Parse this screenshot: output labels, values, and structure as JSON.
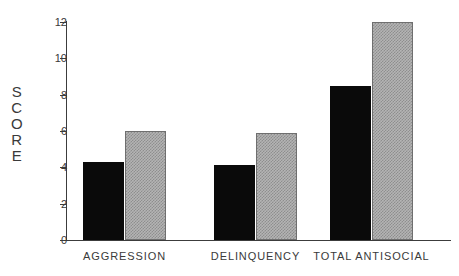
{
  "chart_data": {
    "type": "bar",
    "title": "",
    "xlabel": "",
    "ylabel": "SCORE",
    "categories": [
      "AGGRESSION",
      "DELINQUENCY",
      "TOTAL ANTISOCIAL"
    ],
    "series": [
      {
        "name": "black-series",
        "color": "#0a0a0a",
        "values": [
          4.3,
          4.15,
          8.5
        ]
      },
      {
        "name": "gray-series",
        "color": "#b4b4b4",
        "values": [
          6.0,
          5.9,
          12.0
        ]
      }
    ],
    "ylim": [
      0,
      12
    ],
    "ytick_values": [
      0,
      2,
      4,
      6,
      8,
      10,
      12
    ],
    "ytick_labels": [
      "0",
      "2",
      "4",
      "6",
      "8",
      "10",
      "12"
    ],
    "grid": false,
    "legend": "none"
  },
  "axis": {
    "y_title_letters": [
      "S",
      "C",
      "O",
      "R",
      "E"
    ]
  }
}
